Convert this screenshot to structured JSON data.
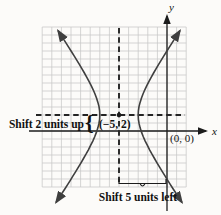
{
  "figure": {
    "axes": {
      "x_label": "x",
      "y_label": "y"
    },
    "points": [
      {
        "name": "center",
        "label": "(−5, 2)",
        "x": -5,
        "y": 2
      },
      {
        "name": "origin",
        "label": "(0, 0)",
        "x": 0,
        "y": 0
      }
    ],
    "annotations": {
      "shift_up": "Shift 2 units up",
      "shift_left": "Shift 5 units left",
      "brace": "{"
    },
    "curve": {
      "type": "hyperbola",
      "orientation": "horizontal",
      "center": {
        "x": -5,
        "y": 2
      },
      "a_units": 2,
      "b_units": 3.5,
      "shift": {
        "dx_units": -5,
        "dy_units": 2
      }
    },
    "grid": {
      "cols": 15,
      "rows": 20,
      "units_per_cell": 1
    },
    "colors": {
      "background": "#fcfbf9",
      "grid_line": "#c7c7c7",
      "axis": "#1c1c1c",
      "dashed": "#242424",
      "curve": "#3f3f3f",
      "text": "#121212"
    }
  }
}
